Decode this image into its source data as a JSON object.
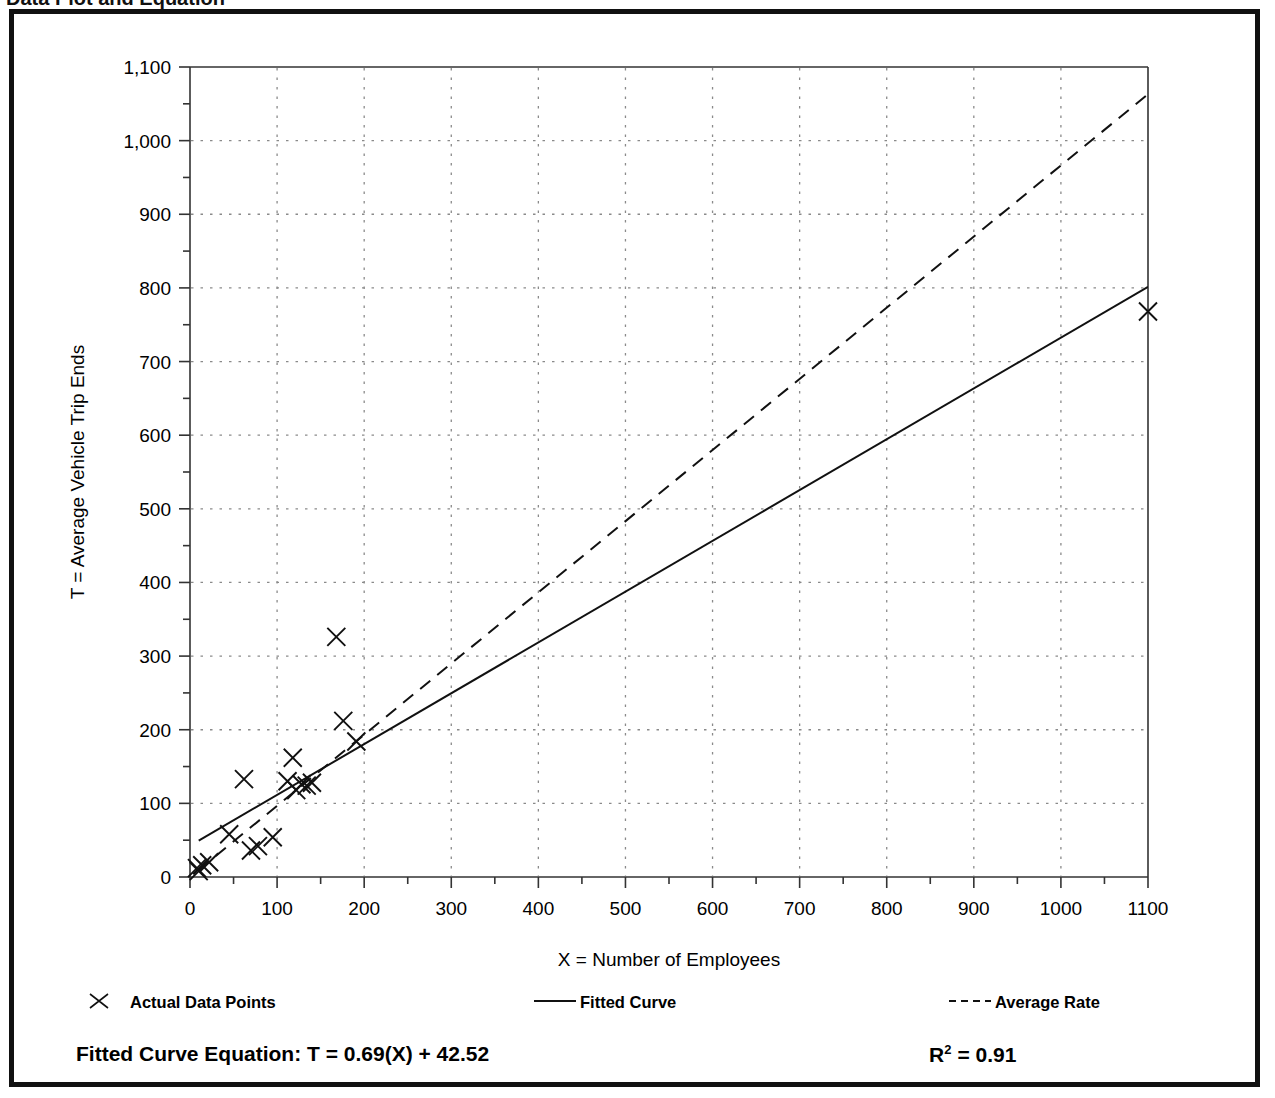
{
  "caption": {
    "text": "Data Plot and Equation"
  },
  "chart_data": {
    "type": "scatter",
    "title": "",
    "xlabel": "X = Number of Employees",
    "ylabel": "T = Average Vehicle Trip Ends",
    "xlim": [
      0,
      1100
    ],
    "ylim": [
      0,
      1100
    ],
    "xticks": [
      0,
      100,
      200,
      300,
      400,
      500,
      600,
      700,
      800,
      900,
      1000,
      1100
    ],
    "xtick_labels": [
      "0",
      "100",
      "200",
      "300",
      "400",
      "500",
      "600",
      "700",
      "800",
      "900",
      "1000",
      "1100"
    ],
    "yticks": [
      0,
      100,
      200,
      300,
      400,
      500,
      600,
      700,
      800,
      900,
      1000,
      1100
    ],
    "ytick_labels": [
      "0",
      "100",
      "200",
      "300",
      "400",
      "500",
      "600",
      "700",
      "800",
      "900",
      "1,000",
      "1,100"
    ],
    "minor_tick_interval": 50,
    "grid": true,
    "grid_style": "dotted",
    "grid_color": "#888888",
    "legend_position": "below-axes",
    "series": [
      {
        "name": "Actual Data Points",
        "type": "scatter",
        "marker": "x",
        "color": "#000000",
        "points": [
          [
            8,
            12
          ],
          [
            10,
            8
          ],
          [
            14,
            16
          ],
          [
            22,
            20
          ],
          [
            45,
            58
          ],
          [
            62,
            133
          ],
          [
            70,
            36
          ],
          [
            78,
            42
          ],
          [
            95,
            54
          ],
          [
            112,
            130
          ],
          [
            118,
            162
          ],
          [
            122,
            118
          ],
          [
            128,
            126
          ],
          [
            134,
            124
          ],
          [
            140,
            128
          ],
          [
            168,
            326
          ],
          [
            176,
            212
          ],
          [
            191,
            184
          ],
          [
            1100,
            768
          ]
        ]
      },
      {
        "name": "Fitted Curve",
        "type": "line",
        "style": "solid",
        "color": "#000000",
        "equation": "T = 0.69(X) + 42.52",
        "slope": 0.69,
        "intercept": 42.52,
        "endpoints": [
          [
            10,
            49.4
          ],
          [
            1100,
            801.5
          ]
        ]
      },
      {
        "name": "Average Rate",
        "type": "line",
        "style": "dashed",
        "color": "#000000",
        "slope": 0.966,
        "intercept": 0,
        "endpoints": [
          [
            10,
            9.7
          ],
          [
            1100,
            1063
          ]
        ]
      }
    ]
  },
  "legend": {
    "items": [
      {
        "label": "Actual Data Points",
        "marker": "x-marker"
      },
      {
        "label": "Fitted Curve",
        "marker": "solid-line"
      },
      {
        "label": "Average Rate",
        "marker": "dashed-line"
      }
    ]
  },
  "footer": {
    "equation_label": "Fitted Curve Equation:",
    "equation_value": "T = 0.69(X) + 42.52",
    "equation_full": "Fitted Curve Equation:  T = 0.69(X) + 42.52",
    "r_squared_base": "R",
    "r_squared_exponent": "2",
    "r_squared_value": "= 0.91"
  }
}
